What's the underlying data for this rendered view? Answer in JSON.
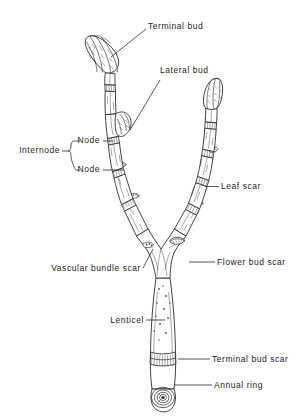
{
  "figure": {
    "background_color": "#ffffff",
    "ink_color": "#2b2b2b",
    "label_color": "#1c1c1c"
  },
  "labels": {
    "terminal_bud": "Terminal bud",
    "lateral_bud": "Lateral bud",
    "node_upper": "Node",
    "node_lower": "Node",
    "internode": "Internode",
    "leaf_scar": "Leaf scar",
    "flower_bud_scar": "Flower bud scar",
    "vascular_bundle_scar": "Vascular bundle scar",
    "lenticel": "Lenticel",
    "terminal_bud_scar": "Terminal bud scar",
    "annual_ring": "Annual ring"
  }
}
